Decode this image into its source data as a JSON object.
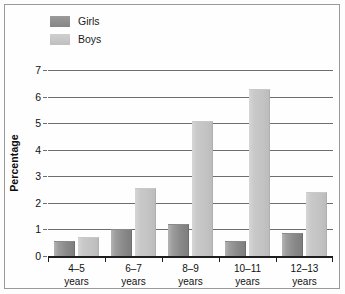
{
  "chart_data": {
    "type": "bar",
    "title": "",
    "xlabel": "",
    "ylabel": "Percentage",
    "ylim": [
      0,
      7
    ],
    "yticks": [
      0,
      1,
      2,
      3,
      4,
      5,
      6,
      7
    ],
    "grid": true,
    "legend_position": "top-left",
    "categories": [
      "4–5 years",
      "6–7 years",
      "8–9 years",
      "10–11 years",
      "12–13 years"
    ],
    "category_lines": [
      {
        "line1": "4–5",
        "line2": "years"
      },
      {
        "line1": "6–7",
        "line2": "years"
      },
      {
        "line1": "8–9",
        "line2": "years"
      },
      {
        "line1": "10–11",
        "line2": "years"
      },
      {
        "line1": "12–13",
        "line2": "years"
      }
    ],
    "series": [
      {
        "name": "Girls",
        "color": "#8f8f8f",
        "values": [
          0.55,
          1.0,
          1.2,
          0.55,
          0.85
        ]
      },
      {
        "name": "Boys",
        "color": "#c6c6c6",
        "values": [
          0.72,
          2.55,
          5.1,
          6.3,
          2.4
        ]
      }
    ]
  },
  "legend": {
    "items": [
      {
        "label": "Girls"
      },
      {
        "label": "Boys"
      }
    ]
  },
  "axis": {
    "y_title": "Percentage",
    "y_tick_labels": [
      "7",
      "6",
      "5",
      "4",
      "3",
      "2",
      "1",
      "0"
    ]
  }
}
